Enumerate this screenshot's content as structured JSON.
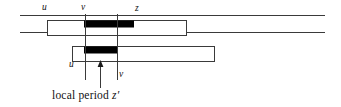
{
  "figure": {
    "name": "local-period-diagram",
    "width": 341,
    "height": 107,
    "background_color": "#ffffff",
    "line_color": "#3a3a3a",
    "fill_color": "#000000",
    "rect_fill": "#ffffff"
  },
  "labels": {
    "top_u": "u",
    "top_v": "v",
    "top_z": "z",
    "bottom_u": "u",
    "bottom_v": "v",
    "caption_text": "local period",
    "caption_symbol": "z",
    "caption_prime": "′"
  },
  "geometry": {
    "baselines": [
      {
        "name": "upper-baseline",
        "x1": 20,
        "y": 15.5,
        "x2": 325
      },
      {
        "name": "lower-baseline",
        "x1": 20,
        "y": 32.5,
        "x2": 325
      }
    ],
    "string_boxes": [
      {
        "name": "upper-occurrence-box",
        "x": 47,
        "y": 20,
        "width": 140,
        "height": 16
      },
      {
        "name": "lower-occurrence-box",
        "x": 72,
        "y": 46,
        "width": 143,
        "height": 16
      }
    ],
    "highlight_bars": [
      {
        "name": "upper-black-bar",
        "x": 84,
        "y": 20.5,
        "width": 50,
        "height": 6.5
      },
      {
        "name": "lower-black-bar",
        "x": 84,
        "y": 46.5,
        "width": 33,
        "height": 6.5
      }
    ],
    "verticals": [
      {
        "name": "v-vertical-line",
        "x": 85,
        "y1": 14,
        "y2": 80
      },
      {
        "name": "z-vertical-line",
        "x": 117,
        "y1": 14,
        "y2": 80
      }
    ],
    "arrow": {
      "name": "local-period-arrow",
      "x": 100,
      "y_tail": 88,
      "y_head": 61
    }
  }
}
